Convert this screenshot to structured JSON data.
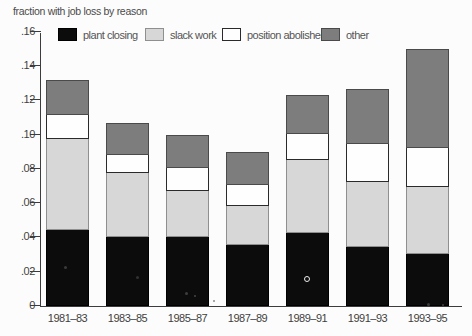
{
  "figure": {
    "background": "#fcfcfc",
    "axis_color": "#3c3c3c"
  },
  "chart_data": {
    "type": "bar",
    "stacked": true,
    "title": "fraction with job loss by reason",
    "xlabel": "",
    "ylabel": "fraction with job loss by reason",
    "categories": [
      "1981–83",
      "1983–85",
      "1985–87",
      "1987–89",
      "1989–91",
      "1991–93",
      "1993–95"
    ],
    "series": [
      {
        "name": "plant closing",
        "color": "#0c0c0c",
        "border": "#000000",
        "values": [
          0.045,
          0.041,
          0.041,
          0.036,
          0.043,
          0.035,
          0.031
        ]
      },
      {
        "name": "slack work",
        "color": "#d7d7d7",
        "border": "#8f8f8f",
        "values": [
          0.053,
          0.037,
          0.027,
          0.023,
          0.043,
          0.038,
          0.039
        ]
      },
      {
        "name": "position abolished",
        "color": "#fefefe",
        "border": "#2a2a2a",
        "values": [
          0.014,
          0.011,
          0.013,
          0.012,
          0.015,
          0.022,
          0.023
        ]
      },
      {
        "name": "other",
        "color": "#7d7d7d",
        "border": "#4a4a4a",
        "values": [
          0.02,
          0.018,
          0.019,
          0.019,
          0.022,
          0.032,
          0.057
        ]
      }
    ],
    "totals": [
      0.132,
      0.107,
      0.1,
      0.09,
      0.123,
      0.127,
      0.15
    ],
    "ylim": [
      0,
      0.16
    ],
    "y_ticks": [
      {
        "value": 0.16,
        "label": ".16"
      },
      {
        "value": 0.14,
        "label": ".14"
      },
      {
        "value": 0.12,
        "label": ".12"
      },
      {
        "value": 0.1,
        "label": ".10"
      },
      {
        "value": 0.08,
        "label": ".08"
      },
      {
        "value": 0.06,
        "label": ".06"
      },
      {
        "value": 0.04,
        "label": ".04"
      },
      {
        "value": 0.02,
        "label": ".02"
      },
      {
        "value": 0.0,
        "label": "0"
      }
    ],
    "grid": false,
    "legend_position": "top"
  },
  "artifacts": [
    {
      "x": 64,
      "y": 266,
      "d": 3,
      "color": "#3b3b3b",
      "ring": false
    },
    {
      "x": 136,
      "y": 276,
      "d": 3,
      "color": "#323232",
      "ring": false
    },
    {
      "x": 185,
      "y": 292,
      "d": 3,
      "color": "#3e3e3e",
      "ring": false
    },
    {
      "x": 194,
      "y": 295,
      "d": 2,
      "color": "#444444",
      "ring": false
    },
    {
      "x": 213,
      "y": 300,
      "d": 2,
      "color": "#8d8d8d",
      "ring": false
    },
    {
      "x": 304,
      "y": 276,
      "d": 6,
      "color": "#ededed",
      "ring": true
    },
    {
      "x": 427,
      "y": 303,
      "d": 3,
      "color": "#3a3a3a",
      "ring": false
    },
    {
      "x": 442,
      "y": 304,
      "d": 2,
      "color": "#404040",
      "ring": false
    }
  ]
}
